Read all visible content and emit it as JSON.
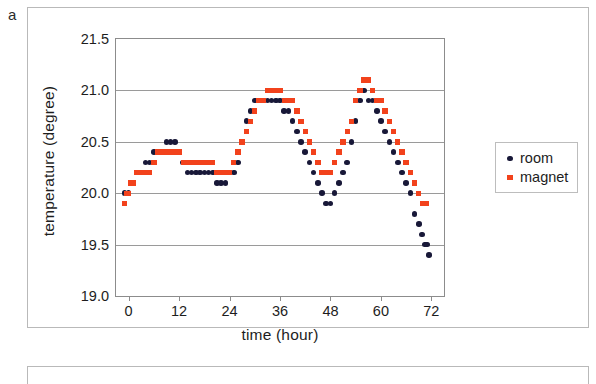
{
  "panel": {
    "label": "a"
  },
  "legend": {
    "position": "right",
    "entries": [
      {
        "name": "room",
        "marker": "circle-icon",
        "color": "#181838"
      },
      {
        "name": "magnet",
        "marker": "square-icon",
        "color": "#f2421c"
      }
    ]
  },
  "chart_data": {
    "type": "scatter",
    "title": "",
    "xlabel": "time (hour)",
    "ylabel": "temperature (degree)",
    "xlim": [
      -3,
      75
    ],
    "ylim": [
      19.0,
      21.5
    ],
    "xticks": [
      0,
      12,
      24,
      36,
      48,
      60,
      72
    ],
    "yticks": [
      19.0,
      19.5,
      20.0,
      20.5,
      21.0,
      21.5
    ],
    "grid": "horizontal",
    "series": [
      {
        "name": "room",
        "color": "#181838",
        "marker": "circle",
        "points": [
          [
            -1.0,
            20.0
          ],
          [
            0.0,
            20.0
          ],
          [
            0.5,
            20.1
          ],
          [
            1.0,
            20.1
          ],
          [
            2.0,
            20.2
          ],
          [
            3.0,
            20.2
          ],
          [
            4.0,
            20.3
          ],
          [
            5.0,
            20.3
          ],
          [
            6.0,
            20.4
          ],
          [
            7.0,
            20.4
          ],
          [
            9.0,
            20.5
          ],
          [
            10.0,
            20.5
          ],
          [
            11.0,
            20.5
          ],
          [
            12.0,
            20.4
          ],
          [
            13.0,
            20.3
          ],
          [
            14.0,
            20.2
          ],
          [
            15.0,
            20.2
          ],
          [
            16.0,
            20.2
          ],
          [
            17.0,
            20.2
          ],
          [
            18.0,
            20.2
          ],
          [
            19.0,
            20.2
          ],
          [
            20.0,
            20.2
          ],
          [
            21.0,
            20.1
          ],
          [
            22.0,
            20.1
          ],
          [
            23.0,
            20.1
          ],
          [
            24.0,
            20.2
          ],
          [
            25.0,
            20.2
          ],
          [
            26.0,
            20.3
          ],
          [
            27.0,
            20.5
          ],
          [
            28.0,
            20.7
          ],
          [
            29.0,
            20.8
          ],
          [
            30.0,
            20.9
          ],
          [
            31.0,
            20.9
          ],
          [
            32.0,
            20.9
          ],
          [
            33.0,
            20.9
          ],
          [
            34.0,
            20.9
          ],
          [
            35.0,
            20.9
          ],
          [
            36.0,
            20.9
          ],
          [
            37.0,
            20.8
          ],
          [
            38.0,
            20.8
          ],
          [
            39.0,
            20.7
          ],
          [
            40.0,
            20.6
          ],
          [
            41.0,
            20.5
          ],
          [
            42.0,
            20.4
          ],
          [
            43.0,
            20.3
          ],
          [
            44.0,
            20.2
          ],
          [
            45.0,
            20.1
          ],
          [
            46.0,
            20.0
          ],
          [
            47.0,
            19.9
          ],
          [
            48.0,
            19.9
          ],
          [
            49.0,
            20.0
          ],
          [
            50.0,
            20.1
          ],
          [
            51.0,
            20.2
          ],
          [
            52.0,
            20.3
          ],
          [
            53.0,
            20.5
          ],
          [
            54.0,
            20.7
          ],
          [
            55.0,
            20.9
          ],
          [
            56.0,
            21.0
          ],
          [
            57.0,
            20.9
          ],
          [
            58.0,
            20.9
          ],
          [
            59.0,
            20.8
          ],
          [
            60.0,
            20.7
          ],
          [
            61.0,
            20.6
          ],
          [
            62.0,
            20.5
          ],
          [
            63.0,
            20.4
          ],
          [
            64.0,
            20.3
          ],
          [
            65.0,
            20.2
          ],
          [
            66.0,
            20.1
          ],
          [
            67.0,
            20.0
          ],
          [
            68.0,
            19.8
          ],
          [
            69.0,
            19.7
          ],
          [
            69.8,
            19.6
          ],
          [
            70.5,
            19.5
          ],
          [
            71.0,
            19.5
          ],
          [
            71.5,
            19.4
          ]
        ]
      },
      {
        "name": "magnet",
        "color": "#f2421c",
        "marker": "square",
        "points": [
          [
            -1.0,
            19.9
          ],
          [
            -0.5,
            20.0
          ],
          [
            0.0,
            20.0
          ],
          [
            0.5,
            20.1
          ],
          [
            1.0,
            20.1
          ],
          [
            2.0,
            20.2
          ],
          [
            3.0,
            20.2
          ],
          [
            4.0,
            20.2
          ],
          [
            5.0,
            20.2
          ],
          [
            6.0,
            20.3
          ],
          [
            7.0,
            20.4
          ],
          [
            8.0,
            20.4
          ],
          [
            9.0,
            20.4
          ],
          [
            10.0,
            20.4
          ],
          [
            11.0,
            20.4
          ],
          [
            12.0,
            20.4
          ],
          [
            13.0,
            20.3
          ],
          [
            14.0,
            20.3
          ],
          [
            15.0,
            20.3
          ],
          [
            16.0,
            20.3
          ],
          [
            17.0,
            20.3
          ],
          [
            18.0,
            20.3
          ],
          [
            19.0,
            20.3
          ],
          [
            20.0,
            20.3
          ],
          [
            21.0,
            20.2
          ],
          [
            22.0,
            20.2
          ],
          [
            23.0,
            20.2
          ],
          [
            24.0,
            20.2
          ],
          [
            25.0,
            20.3
          ],
          [
            26.0,
            20.4
          ],
          [
            27.0,
            20.5
          ],
          [
            28.0,
            20.6
          ],
          [
            29.0,
            20.7
          ],
          [
            30.0,
            20.8
          ],
          [
            31.0,
            20.9
          ],
          [
            32.0,
            20.9
          ],
          [
            33.0,
            21.0
          ],
          [
            34.0,
            21.0
          ],
          [
            35.0,
            21.0
          ],
          [
            36.0,
            21.0
          ],
          [
            37.0,
            20.9
          ],
          [
            38.0,
            20.9
          ],
          [
            39.0,
            20.9
          ],
          [
            40.0,
            20.8
          ],
          [
            41.0,
            20.7
          ],
          [
            42.0,
            20.6
          ],
          [
            43.0,
            20.5
          ],
          [
            44.0,
            20.4
          ],
          [
            45.0,
            20.3
          ],
          [
            46.0,
            20.2
          ],
          [
            47.0,
            20.2
          ],
          [
            48.0,
            20.2
          ],
          [
            49.0,
            20.3
          ],
          [
            50.0,
            20.4
          ],
          [
            51.0,
            20.5
          ],
          [
            52.0,
            20.6
          ],
          [
            53.0,
            20.7
          ],
          [
            54.0,
            20.9
          ],
          [
            55.0,
            21.0
          ],
          [
            56.0,
            21.1
          ],
          [
            57.0,
            21.1
          ],
          [
            58.0,
            21.0
          ],
          [
            59.0,
            20.9
          ],
          [
            60.0,
            20.9
          ],
          [
            61.0,
            20.8
          ],
          [
            62.0,
            20.7
          ],
          [
            63.0,
            20.6
          ],
          [
            64.0,
            20.5
          ],
          [
            65.0,
            20.4
          ],
          [
            66.0,
            20.3
          ],
          [
            67.0,
            20.2
          ],
          [
            68.0,
            20.1
          ],
          [
            69.0,
            20.0
          ],
          [
            70.0,
            19.9
          ],
          [
            70.8,
            19.9
          ]
        ]
      }
    ]
  }
}
